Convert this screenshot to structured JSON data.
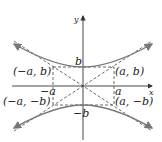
{
  "diagram": {
    "axes": {
      "x_label": "x",
      "y_label": "y"
    },
    "tick_labels": {
      "a": "a",
      "neg_a": "−a",
      "b": "b",
      "neg_b": "−b"
    },
    "points": {
      "top_left": "(−a, b)",
      "top_right": "(a, b)",
      "bottom_left": "(−a, −b)",
      "bottom_right": "(a, −b)"
    },
    "colors": {
      "curve": "#777777",
      "axes": "#333333",
      "dashed": "#444444",
      "text": "#222222"
    }
  }
}
